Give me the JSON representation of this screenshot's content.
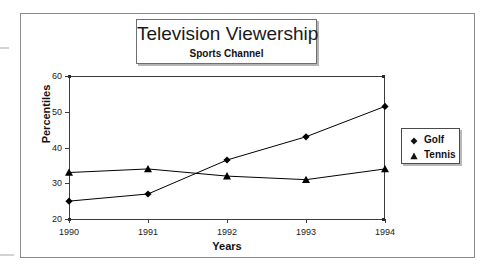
{
  "figure": {
    "title": "Television Viewership",
    "subtitle": "Sports Channel"
  },
  "chart_data": {
    "type": "line",
    "title": "Television Viewership",
    "subtitle": "Sports Channel",
    "xlabel": "Years",
    "ylabel": "Percentiles",
    "categories": [
      "1990",
      "1991",
      "1992",
      "1993",
      "1994"
    ],
    "x_tick_labels": [
      "1990",
      "1991",
      "1992",
      "1993",
      "1994"
    ],
    "y_tick_labels": [
      "20",
      "30",
      "40",
      "50",
      "60"
    ],
    "ylim": [
      20,
      60
    ],
    "y_step": 10,
    "grid": false,
    "legend_position": "right",
    "series": [
      {
        "name": "Golf",
        "marker": "diamond",
        "color": "#000000",
        "values": [
          25,
          27,
          36.5,
          43,
          51.5
        ]
      },
      {
        "name": "Tennis",
        "marker": "triangle",
        "color": "#000000",
        "values": [
          33,
          34,
          32,
          31,
          34
        ]
      }
    ]
  },
  "legend": {
    "items": [
      {
        "label": "Golf",
        "marker": "diamond"
      },
      {
        "label": "Tennis",
        "marker": "triangle"
      }
    ]
  },
  "colors": {
    "line": "#1a1a1a",
    "axis": "#3c3c3c",
    "frame": "#8a8a8a",
    "text": "#111111"
  }
}
